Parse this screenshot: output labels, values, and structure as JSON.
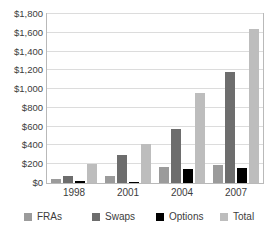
{
  "chart_data": {
    "type": "bar",
    "title": "",
    "subtitle": "",
    "xlabel": "",
    "ylabel": "",
    "categories": [
      "1998",
      "2001",
      "2004",
      "2007"
    ],
    "series": [
      {
        "name": "FRAs",
        "color": "#9b9b9b",
        "values": [
          40,
          75,
          170,
          190
        ]
      },
      {
        "name": "Swaps",
        "color": "#6d6d6d",
        "values": [
          75,
          295,
          575,
          1182
        ]
      },
      {
        "name": "Options",
        "color": "#000000",
        "values": [
          20,
          15,
          145,
          165
        ]
      },
      {
        "name": "Total",
        "color": "#bdbdbd",
        "values": [
          205,
          420,
          958,
          1640
        ]
      }
    ],
    "ylim": [
      0,
      1800
    ],
    "ytick_values": [
      0,
      200,
      400,
      600,
      800,
      1000,
      1200,
      1400,
      1600,
      1800
    ],
    "ytick_labels": [
      "$0",
      "$200",
      "$400",
      "$600",
      "$800",
      "$1,000",
      "$1,200",
      "$1,400",
      "$1,600",
      "$1,800"
    ],
    "grid": true,
    "legend_position": "bottom",
    "legend_entries": [
      "FRAs",
      "Swaps",
      "Options",
      "Total"
    ],
    "annotations": []
  },
  "axes": {
    "y_labels": [
      {
        "text": "$1,800"
      },
      {
        "text": "$1,600"
      },
      {
        "text": "$1,400"
      },
      {
        "text": "$1,200"
      },
      {
        "text": "$1,000"
      },
      {
        "text": "$800"
      },
      {
        "text": "$600"
      },
      {
        "text": "$400"
      },
      {
        "text": "$200"
      },
      {
        "text": "$0"
      }
    ],
    "x_labels": [
      {
        "text": "1998"
      },
      {
        "text": "2001"
      },
      {
        "text": "2004"
      },
      {
        "text": "2007"
      }
    ]
  },
  "legend": {
    "items": [
      {
        "label": "FRAs",
        "color": "#9b9b9b"
      },
      {
        "label": "Swaps",
        "color": "#6d6d6d"
      },
      {
        "label": "Options",
        "color": "#000000"
      },
      {
        "label": "Total",
        "color": "#bdbdbd"
      }
    ]
  }
}
